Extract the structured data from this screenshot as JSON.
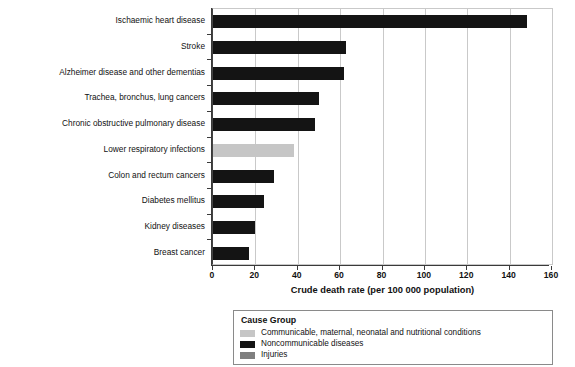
{
  "chart_data": {
    "type": "bar",
    "orientation": "horizontal",
    "title": "",
    "xlabel": "Crude death rate (per 100 000 population)",
    "ylabel": "",
    "xlim": [
      0,
      160
    ],
    "xticks": [
      0,
      20,
      40,
      60,
      80,
      100,
      120,
      140,
      160
    ],
    "grid": true,
    "grid_axis": "x",
    "categories": [
      "Ischaemic heart disease",
      "Stroke",
      "Alzheimer disease and other dementias",
      "Trachea, bronchus, lung cancers",
      "Chronic obstructive pulmonary disease",
      "Lower respiratory infections",
      "Colon and rectum cancers",
      "Diabetes mellitus",
      "Kidney diseases",
      "Breast cancer"
    ],
    "values": [
      148,
      63,
      62,
      50,
      48,
      38,
      29,
      24,
      20,
      17
    ],
    "groups": [
      "Noncommunicable diseases",
      "Noncommunicable diseases",
      "Noncommunicable diseases",
      "Noncommunicable diseases",
      "Noncommunicable diseases",
      "Communicable, maternal, neonatal and nutritional conditions",
      "Noncommunicable diseases",
      "Noncommunicable diseases",
      "Noncommunicable diseases",
      "Noncommunicable diseases"
    ],
    "colors": [
      "#141414",
      "#141414",
      "#141414",
      "#141414",
      "#141414",
      "#c6c6c6",
      "#141414",
      "#141414",
      "#141414",
      "#141414"
    ],
    "legend": {
      "position": "bottom",
      "title": "Cause Group",
      "entries": [
        {
          "label": "Communicable, maternal, neonatal and nutritional conditions",
          "color": "#c6c6c6"
        },
        {
          "label": "Noncommunicable diseases",
          "color": "#141414"
        },
        {
          "label": "Injuries",
          "color": "#7f7f7f"
        }
      ]
    }
  },
  "axis": {
    "x_tick_labels": [
      "0",
      "20",
      "40",
      "60",
      "80",
      "100",
      "120",
      "140",
      "160"
    ],
    "x_title": "Crude death rate (per 100 000 population)"
  }
}
